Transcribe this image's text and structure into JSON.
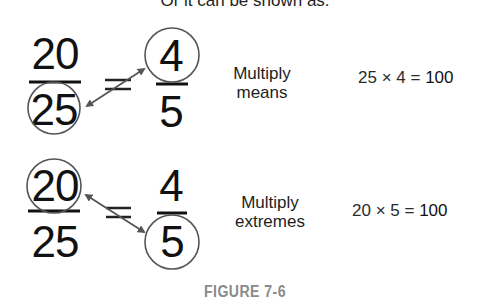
{
  "intro_text": "Or it can be shown as:",
  "diagrams": [
    {
      "id": "means",
      "left_fraction": {
        "numerator": "20",
        "denominator": "25",
        "circled": "denominator"
      },
      "equals_sign": "=",
      "right_fraction": {
        "numerator": "4",
        "denominator": "5",
        "circled": "numerator"
      },
      "label_line1": "Multiply",
      "label_line2": "means",
      "equation": {
        "lhs": "25 × 4 = ",
        "result": "100"
      }
    },
    {
      "id": "extremes",
      "left_fraction": {
        "numerator": "20",
        "denominator": "25",
        "circled": "numerator"
      },
      "equals_sign": "=",
      "right_fraction": {
        "numerator": "4",
        "denominator": "5",
        "circled": "denominator"
      },
      "label_line1": "Multiply",
      "label_line2": "extremes",
      "equation": {
        "lhs": "20 × 5 = ",
        "result": "100"
      }
    }
  ],
  "caption": "FIGURE 7-6",
  "colors": {
    "text": "#111111",
    "circle_stroke": "#555555",
    "arrow": "#555555",
    "caption": "#8a8a8a"
  }
}
